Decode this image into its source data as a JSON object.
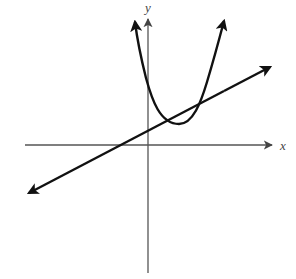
{
  "diagram": {
    "title": "",
    "axes": {
      "x_label": "x",
      "y_label": "y",
      "origin_px": [
        148,
        145
      ]
    },
    "curves": [
      {
        "name": "parabola",
        "type": "quadratic",
        "opens": "up",
        "vertex_px": [
          179,
          124
        ],
        "left_arrow_px": [
          134,
          18
        ],
        "right_arrow_px": [
          226,
          17
        ]
      },
      {
        "name": "line",
        "type": "linear",
        "slope": "positive",
        "start_arrow_px": [
          26,
          194
        ],
        "end_arrow_px": [
          273,
          66
        ]
      }
    ],
    "intersections_px": [
      [
        170,
        119
      ],
      [
        199,
        104
      ]
    ],
    "colors": {
      "curve": "#111111",
      "axis": "#555555",
      "background": "#ffffff"
    }
  }
}
